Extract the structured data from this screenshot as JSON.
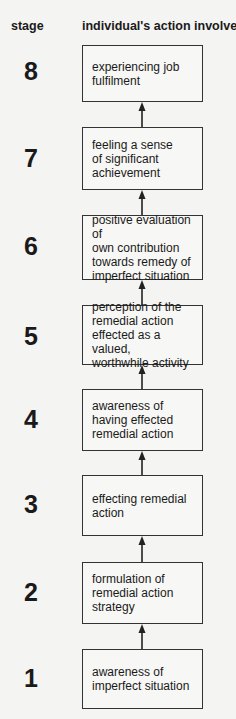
{
  "header": {
    "stage_label": "stage",
    "action_label": "individual's action involves:"
  },
  "stages": [
    {
      "number": "8",
      "text": "experiencing job\nfulfilment"
    },
    {
      "number": "7",
      "text": "feeling a sense\nof significant\nachievement"
    },
    {
      "number": "6",
      "text": "positive evaluation of\nown contribution\ntowards remedy of\nimperfect situation"
    },
    {
      "number": "5",
      "text": "perception of the\nremedial action\neffected as a valued,\nworthwhile activity"
    },
    {
      "number": "4",
      "text": "awareness of\nhaving effected\nremedial action"
    },
    {
      "number": "3",
      "text": "effecting remedial\naction"
    },
    {
      "number": "2",
      "text": "formulation of\nremedial action\nstrategy"
    },
    {
      "number": "1",
      "text": "awareness of\nimperfect situation"
    }
  ],
  "colors": {
    "background": "#f4f4f2",
    "line": "#333333",
    "text": "#1a1a1a"
  }
}
